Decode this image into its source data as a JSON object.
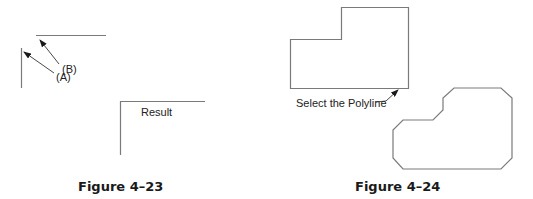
{
  "figures": [
    {
      "id": "fig-4-23",
      "caption": "Figure 4–23",
      "labels": {
        "point_a": "(A)",
        "point_b": "(B)",
        "result": "Result"
      }
    },
    {
      "id": "fig-4-24",
      "caption": "Figure 4–24",
      "labels": {
        "select": "Select the Polyline"
      }
    }
  ],
  "colors": {
    "line": "#7a7a7a",
    "arrow": "#2a2a2a",
    "text": "#222222"
  }
}
